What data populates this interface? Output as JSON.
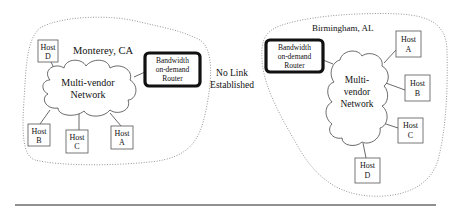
{
  "diagram": {
    "sites": {
      "left": {
        "location": "Monterey, CA",
        "network": [
          "Multi-vendor",
          "Network"
        ],
        "router": [
          "Bandwidth",
          "on-demand",
          "Router"
        ],
        "hosts": [
          {
            "id": "D",
            "label": "Host",
            "letter": "D"
          },
          {
            "id": "B",
            "label": "Host",
            "letter": "B"
          },
          {
            "id": "C",
            "label": "Host",
            "letter": "C"
          },
          {
            "id": "A",
            "label": "Host",
            "letter": "A"
          }
        ]
      },
      "right": {
        "location": "Birmingham, AL",
        "network": [
          "Multi-",
          "vendor",
          "Network"
        ],
        "router": [
          "Bandwidth",
          "on-demand",
          "Router"
        ],
        "hosts": [
          {
            "id": "A",
            "label": "Host",
            "letter": "A"
          },
          {
            "id": "B",
            "label": "Host",
            "letter": "B"
          },
          {
            "id": "C",
            "label": "Host",
            "letter": "C"
          },
          {
            "id": "D",
            "label": "Host",
            "letter": "D"
          }
        ]
      }
    },
    "link_status": [
      "No Link",
      "Established"
    ]
  }
}
